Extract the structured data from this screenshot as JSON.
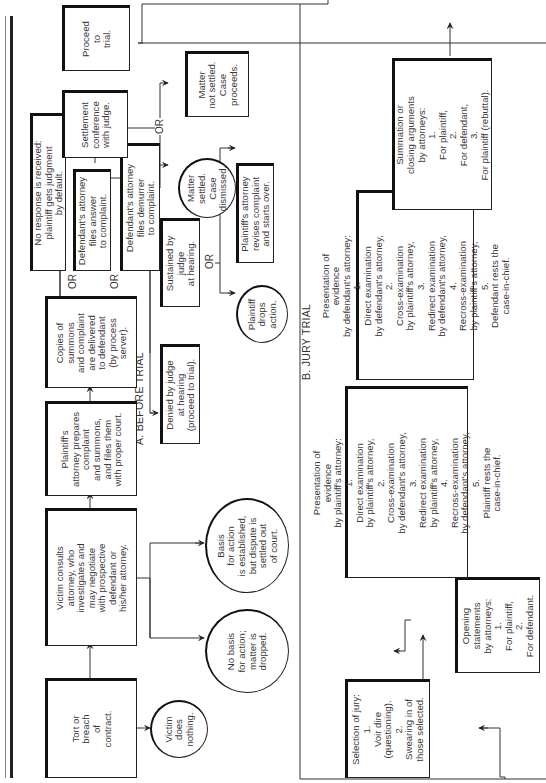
{
  "sections": {
    "before_trial": "A. BEFORE TRIAL",
    "jury_trial": "B. JURY TRIAL"
  },
  "before_trial": {
    "tort": "Tort or\nbreach\nof\ncontract.",
    "victim_does_nothing": "Victim\ndoes\nnothing.",
    "victim_consults": "Victim consults\nattorney, who\ninvestigates and\nmay negotiate\nwith prospective\ndefendant or\nhis/her attorney.",
    "no_basis": "No basis\nfor action;\nmatter is\ndropped.",
    "basis_established": "Basis\nfor action\nis established,\nbut dispute is\nsettled out\nof court.",
    "plaintiff_prepares": "Plaintiff's\nattorney prepares\ncomplaint\nand summons,\nand files them\nwith proper court.",
    "copies_delivered": "Copies of\nsummons\nand complaint\nare delivered\nto defendant\n(by process\nserver).",
    "no_response": "No response is received:\nplaintiff gets judgment\nby default.",
    "files_answer": "Defendant's attorney\nfiles answer\nto complaint.",
    "files_demurrer": "Defendant's attorney\nfiles demurrer\nto complaint.",
    "denied_by_judge": "Denied by judge\nat hearing\n(proceed to trial).",
    "sustained_by_judge": "Sustained by\njudge\nat hearing.",
    "plaintiff_drops": "Plaintiff\ndrops\naction.",
    "plaintiff_revises": "Plaintiff's attorney\nrevises complaint\nand starts over.",
    "settlement_conference": "Settlement\nconference\nwith judge.",
    "matter_settled": "Matter\nsettled.\nCase\ndismissed.",
    "matter_not_settled": "Matter\nnot settled.\nCase\nproceeds.",
    "proceed_to_trial": "Proceed\nto\ntrial."
  },
  "jury_trial": {
    "selection_of_jury": "Selection of jury:\n1.\nVoir dire\n(questioning).\n2.\nSwearing in of\nthose selected.",
    "opening_statements": "Opening\nstatements\nby attorneys:\n1.\nFor plaintiff,\n2.\nFor defendant.",
    "plaintiff_evidence": "Presentation of\nevidence\nby plaintiff's attorney:\n1.\nDirect examination\nby plaintiff's attorney,\n2.\nCross-examination\nby defendant's attorney,\n3.\nRedirect examination\nby plaintiff's attorney,\n4.\nRecross-examination\nby defendant's attorney,\n5.\nPlaintiff rests the\ncase-in-chief.",
    "defendant_evidence": "Presentation of\nevidence\nby defendant's attorney:\n1.\nDirect examination\nby defendant's attorney,\n2.\nCross-examination\nby plaintiff's attorney,\n3.\nRedirect examination\nby defendant's attorney,\n4.\nRecross-examination\nby plaintiff's attorney,\n5.\nDefendant rests the\ncase-in-chief.",
    "summation": "Summation or\nclosing arguments\nby attorneys:\n1.\nFor plaintiff,\n2.\nFor defendant,\n3.\nFor plaintiff (rebuttal)."
  },
  "connectors": {
    "or": "OR"
  }
}
